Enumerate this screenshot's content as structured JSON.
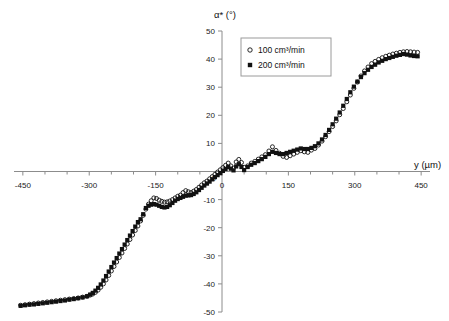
{
  "figure": {
    "name": "alpha-star-vs-y-scatter-plot",
    "background": "#ffffff"
  },
  "axes": {
    "x": {
      "label": "y (µm)",
      "ticks": [
        -450,
        -300,
        -150,
        0,
        150,
        300,
        450
      ],
      "tick_labels": [
        "-450",
        "-300",
        "-150",
        "0",
        "150",
        "300",
        "450"
      ],
      "minor_step": 50,
      "min": -470,
      "max": 470,
      "position": "zero-crossing"
    },
    "y": {
      "label": "α* (°)",
      "ticks": [
        -50,
        -40,
        -30,
        -20,
        -10,
        0,
        10,
        20,
        30,
        40,
        50
      ],
      "tick_labels": [
        "-50",
        "-40",
        "-30",
        "-20",
        "-10",
        "0",
        "10",
        "20",
        "30",
        "40",
        "50"
      ],
      "min": -50,
      "max": 50
    },
    "grid": false,
    "line_color": "#8c8c8c"
  },
  "legend": {
    "position": "upper-center-right",
    "border_color": "#9a9a9a",
    "entries": [
      {
        "label": "100 cm³/min",
        "marker": "open-circle",
        "color": "#111111"
      },
      {
        "label": "200 cm³/min",
        "marker": "filled-square",
        "color": "#111111"
      }
    ]
  },
  "chart_data": {
    "type": "scatter",
    "title": "",
    "xlabel": "y (µm)",
    "ylabel": "α* (°)",
    "xlim": [
      -470,
      470
    ],
    "ylim": [
      -50,
      50
    ],
    "grid": false,
    "legend_position": "upper-center-right",
    "series": [
      {
        "name": "100 cm³/min",
        "marker": "open-circle",
        "color": "#111111",
        "x": [
          -455,
          -445,
          -435,
          -425,
          -415,
          -405,
          -395,
          -385,
          -375,
          -365,
          -355,
          -345,
          -335,
          -325,
          -315,
          -305,
          -298,
          -292,
          -286,
          -280,
          -274,
          -268,
          -262,
          -256,
          -250,
          -244,
          -238,
          -232,
          -226,
          -220,
          -214,
          -208,
          -202,
          -196,
          -190,
          -184,
          -178,
          -172,
          -166,
          -160,
          -154,
          -148,
          -142,
          -136,
          -130,
          -124,
          -118,
          -112,
          -106,
          -100,
          -94,
          -88,
          -82,
          -76,
          -70,
          -64,
          -58,
          -52,
          -46,
          -40,
          -34,
          -28,
          -22,
          -16,
          -10,
          -4,
          2,
          8,
          14,
          20,
          26,
          32,
          38,
          44,
          50,
          58,
          66,
          74,
          82,
          90,
          98,
          106,
          114,
          122,
          130,
          138,
          146,
          154,
          162,
          170,
          178,
          186,
          194,
          202,
          210,
          218,
          226,
          234,
          242,
          250,
          258,
          266,
          274,
          282,
          290,
          298,
          306,
          314,
          322,
          330,
          338,
          346,
          354,
          362,
          370,
          378,
          386,
          394,
          402,
          410,
          418,
          426,
          434,
          442
        ],
        "y": [
          -47.6,
          -47.4,
          -47.2,
          -47.0,
          -46.8,
          -46.6,
          -46.4,
          -46.2,
          -46.0,
          -45.8,
          -45.6,
          -45.4,
          -45.2,
          -45.0,
          -44.7,
          -44.4,
          -44.0,
          -43.6,
          -43.0,
          -42.2,
          -41.2,
          -40.0,
          -38.6,
          -37.0,
          -35.4,
          -33.8,
          -32.2,
          -30.6,
          -29.0,
          -27.4,
          -25.8,
          -24.2,
          -22.6,
          -21.0,
          -19.4,
          -17.6,
          -15.6,
          -13.4,
          -11.6,
          -10.4,
          -9.4,
          -9.6,
          -10.2,
          -10.6,
          -10.9,
          -10.8,
          -10.5,
          -10.0,
          -9.4,
          -8.8,
          -8.4,
          -7.5,
          -6.8,
          -7.2,
          -7.5,
          -7.0,
          -6.4,
          -5.6,
          -4.8,
          -4.0,
          -3.4,
          -2.6,
          -1.8,
          -1.0,
          -0.2,
          0.6,
          1.4,
          2.2,
          3.0,
          2.0,
          1.2,
          3.4,
          4.3,
          3.2,
          1.5,
          2.0,
          3.0,
          3.6,
          4.4,
          5.2,
          6.0,
          7.3,
          8.8,
          7.5,
          6.5,
          5.4,
          5.0,
          5.6,
          6.2,
          6.8,
          7.4,
          7.0,
          6.8,
          7.6,
          8.2,
          9.4,
          10.8,
          12.4,
          14.2,
          16.0,
          18.0,
          20.2,
          22.4,
          24.8,
          27.2,
          29.6,
          31.8,
          34.0,
          35.8,
          37.2,
          38.4,
          39.2,
          39.9,
          40.5,
          41.0,
          41.4,
          41.8,
          42.1,
          42.4,
          42.6,
          42.7,
          42.6,
          42.5,
          42.4
        ]
      },
      {
        "name": "200 cm³/min",
        "marker": "filled-square",
        "color": "#111111",
        "x": [
          -455,
          -445,
          -435,
          -425,
          -415,
          -405,
          -395,
          -385,
          -375,
          -365,
          -355,
          -345,
          -335,
          -325,
          -315,
          -305,
          -298,
          -292,
          -286,
          -280,
          -274,
          -268,
          -262,
          -256,
          -250,
          -244,
          -238,
          -232,
          -226,
          -220,
          -214,
          -208,
          -202,
          -196,
          -190,
          -184,
          -178,
          -172,
          -166,
          -160,
          -154,
          -148,
          -142,
          -136,
          -130,
          -124,
          -118,
          -112,
          -106,
          -100,
          -94,
          -88,
          -82,
          -76,
          -70,
          -64,
          -58,
          -52,
          -46,
          -40,
          -34,
          -28,
          -22,
          -16,
          -10,
          -4,
          2,
          8,
          14,
          20,
          26,
          32,
          38,
          44,
          50,
          58,
          66,
          74,
          82,
          90,
          98,
          106,
          114,
          122,
          130,
          138,
          146,
          154,
          162,
          170,
          178,
          186,
          194,
          202,
          210,
          218,
          226,
          234,
          242,
          250,
          258,
          266,
          274,
          282,
          290,
          298,
          306,
          314,
          322,
          330,
          338,
          346,
          354,
          362,
          370,
          378,
          386,
          394,
          402,
          410,
          418,
          426,
          434,
          442
        ],
        "y": [
          -47.8,
          -47.6,
          -47.4,
          -47.3,
          -47.1,
          -46.9,
          -46.7,
          -46.5,
          -46.3,
          -46.1,
          -45.9,
          -45.6,
          -45.4,
          -45.1,
          -44.8,
          -44.4,
          -43.8,
          -43.2,
          -42.4,
          -41.4,
          -40.2,
          -38.8,
          -37.2,
          -35.6,
          -34.0,
          -32.4,
          -30.8,
          -29.2,
          -27.6,
          -26.0,
          -24.4,
          -22.8,
          -21.2,
          -19.6,
          -18.0,
          -17.0,
          -15.2,
          -13.0,
          -12.2,
          -11.8,
          -11.6,
          -11.8,
          -12.2,
          -12.6,
          -12.8,
          -12.6,
          -12.0,
          -11.2,
          -10.4,
          -9.8,
          -9.4,
          -9.0,
          -8.6,
          -8.5,
          -8.4,
          -8.0,
          -7.4,
          -6.6,
          -5.8,
          -5.0,
          -4.3,
          -3.6,
          -2.8,
          -2.0,
          -1.3,
          -0.6,
          0.2,
          0.9,
          1.6,
          1.0,
          0.4,
          1.8,
          2.6,
          1.6,
          0.5,
          1.6,
          2.4,
          3.0,
          3.7,
          4.4,
          5.2,
          6.2,
          7.0,
          6.6,
          6.2,
          6.2,
          6.6,
          7.0,
          7.4,
          7.8,
          8.2,
          8.0,
          8.0,
          8.4,
          9.0,
          10.0,
          11.4,
          13.0,
          14.8,
          16.8,
          18.8,
          21.0,
          23.4,
          25.8,
          28.2,
          30.2,
          32.0,
          33.6,
          35.0,
          36.2,
          37.2,
          38.0,
          38.8,
          39.4,
          40.0,
          40.4,
          40.8,
          41.2,
          41.5,
          41.8,
          41.6,
          41.3,
          41.1,
          41.0
        ]
      }
    ]
  }
}
